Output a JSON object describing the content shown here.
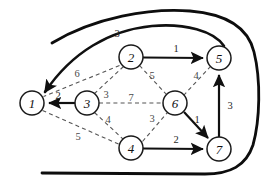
{
  "figure": {
    "width": 265,
    "height": 188,
    "background": "#ffffff",
    "ink_color": "#101010",
    "dashed_color": "#555555"
  },
  "nodes": [
    {
      "id": "1",
      "label": "1",
      "cx": 32,
      "cy": 103,
      "r": 12
    },
    {
      "id": "2",
      "label": "2",
      "cx": 131,
      "cy": 57,
      "r": 12
    },
    {
      "id": "3",
      "label": "3",
      "cx": 87,
      "cy": 103,
      "r": 12
    },
    {
      "id": "4",
      "label": "4",
      "cx": 131,
      "cy": 148,
      "r": 12
    },
    {
      "id": "5",
      "label": "5",
      "cx": 219,
      "cy": 58,
      "r": 12
    },
    {
      "id": "6",
      "label": "6",
      "cx": 175,
      "cy": 103,
      "r": 12
    },
    {
      "id": "7",
      "label": "7",
      "cx": 219,
      "cy": 149,
      "r": 12
    }
  ],
  "edges": [
    {
      "id": "e-3-1",
      "from": "3",
      "to": "1",
      "weight": "2",
      "style": "solid",
      "directed": true,
      "label_x": 58,
      "label_y": 95
    },
    {
      "id": "e-2-5",
      "from": "2",
      "to": "5",
      "weight": "1",
      "style": "solid",
      "directed": true,
      "label_x": 176,
      "label_y": 48
    },
    {
      "id": "e-4-7",
      "from": "4",
      "to": "7",
      "weight": "2",
      "style": "solid",
      "directed": true,
      "label_x": 176,
      "label_y": 139
    },
    {
      "id": "e-6-7",
      "from": "6",
      "to": "7",
      "weight": "1",
      "style": "solid",
      "directed": true,
      "label_x": 197,
      "label_y": 119
    },
    {
      "id": "e-7-5",
      "from": "7",
      "to": "5",
      "weight": "3",
      "style": "solid",
      "directed": true,
      "label_x": 230,
      "label_y": 105
    },
    {
      "id": "e-5-1",
      "from": "5",
      "to": "1",
      "weight": "3",
      "style": "arc",
      "directed": true,
      "label_x": 117,
      "label_y": 33
    },
    {
      "id": "e-2-1",
      "from": "2",
      "to": "1",
      "weight": "6",
      "style": "dashed",
      "directed": false,
      "label_x": 77,
      "label_y": 73
    },
    {
      "id": "e-2-3",
      "from": "2",
      "to": "3",
      "weight": "3",
      "style": "dashed",
      "directed": false,
      "label_x": 106,
      "label_y": 94
    },
    {
      "id": "e-2-6",
      "from": "2",
      "to": "6",
      "weight": "5",
      "style": "dashed",
      "directed": false,
      "label_x": 152,
      "label_y": 75
    },
    {
      "id": "e-6-5",
      "from": "6",
      "to": "5",
      "weight": "4",
      "style": "dashed",
      "directed": false,
      "label_x": 196,
      "label_y": 75
    },
    {
      "id": "e-3-6",
      "from": "3",
      "to": "6",
      "weight": "7",
      "style": "dashed",
      "directed": false,
      "label_x": 131,
      "label_y": 97
    },
    {
      "id": "e-3-4",
      "from": "3",
      "to": "4",
      "weight": "4",
      "style": "dashed",
      "directed": false,
      "label_x": 108,
      "label_y": 119
    },
    {
      "id": "e-4-6",
      "from": "4",
      "to": "6",
      "weight": "3",
      "style": "dashed",
      "directed": false,
      "label_x": 152,
      "label_y": 118
    },
    {
      "id": "e-1-4",
      "from": "1",
      "to": "4",
      "weight": "5",
      "style": "dashed",
      "directed": false,
      "label_x": 78,
      "label_y": 136
    }
  ],
  "boundary": {
    "id": "outer-boundary",
    "description": "open thick curve enclosing the graph from the upper-left around the right side to the lower-left"
  }
}
